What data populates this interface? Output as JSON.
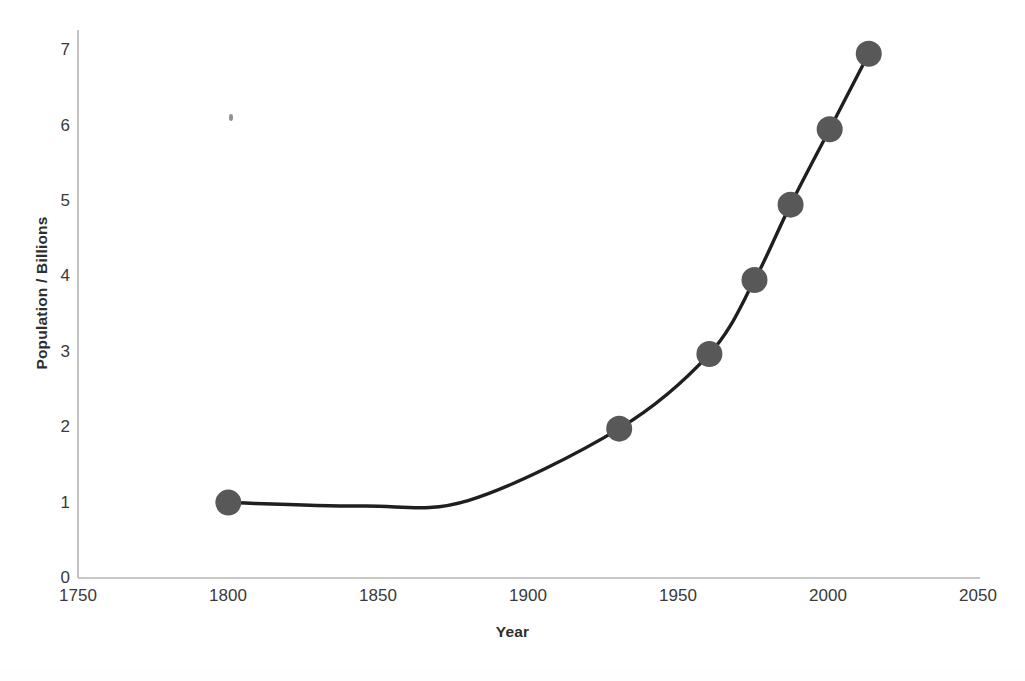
{
  "chart_data": {
    "type": "line",
    "title": "",
    "xlabel": "Year",
    "ylabel": "Population / Billions",
    "xlim": [
      1750,
      2050
    ],
    "ylim": [
      0,
      7
    ],
    "xticks": [
      1750,
      1800,
      1850,
      1900,
      1950,
      2000,
      2050
    ],
    "yticks": [
      0,
      1,
      2,
      3,
      4,
      5,
      6,
      7
    ],
    "grid": false,
    "legend": "none",
    "series": [
      {
        "name": "World population",
        "marker": "circle",
        "marker_color": "#585858",
        "line_color": "#1f1f1f",
        "x": [
          1800,
          1930,
          1960,
          1975,
          1987,
          2000,
          2013
        ],
        "y": [
          1.0,
          1.98,
          2.97,
          3.95,
          4.95,
          5.95,
          6.95
        ]
      }
    ],
    "trend_note": "Smooth curve dips marginally below 1.0 billion between about 1840 and 1870 before rising steeply after 1900."
  },
  "axes": {
    "y_title": "Population / Billions",
    "x_title": "Year",
    "y_tick_labels": [
      "7",
      "6",
      "5",
      "4",
      "3",
      "2",
      "1",
      "0"
    ],
    "x_tick_labels": [
      "1750",
      "1800",
      "1850",
      "1900",
      "1950",
      "2000",
      "2050"
    ]
  },
  "colors": {
    "marker": "#585858",
    "line": "#1f1f1f",
    "axis": "#b4b4b4",
    "tick_text": "#3a3a3a",
    "title_text": "#2e2e2e",
    "background": "#ffffff"
  }
}
